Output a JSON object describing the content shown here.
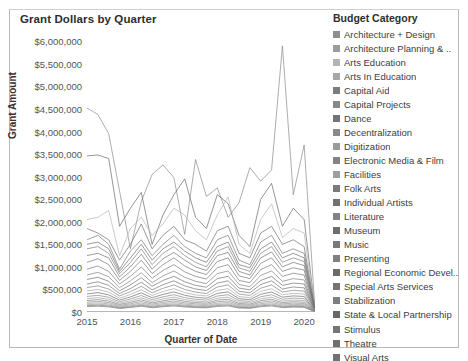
{
  "chart_title": "Grant Dollars by Quarter",
  "axes": {
    "y_title": "Grant Amount",
    "x_title": "Quarter of Date",
    "y_ticks": [
      "$0",
      "$500,000",
      "$1,000,000",
      "$1,500,000",
      "$2,000,000",
      "$2,500,000",
      "$3,000,000",
      "$3,500,000",
      "$4,000,000",
      "$4,500,000",
      "$5,000,000",
      "$5,500,000",
      "$6,000,000"
    ],
    "x_ticks": [
      "2015",
      "2016",
      "2017",
      "2018",
      "2019",
      "2020"
    ]
  },
  "legend": {
    "title": "Budget Category",
    "items": [
      {
        "label": "Architecture + Design",
        "color": "#8e8e8e"
      },
      {
        "label": "Architecture Planning & ..",
        "color": "#9c9c9c"
      },
      {
        "label": "Arts Education",
        "color": "#b4b4b4"
      },
      {
        "label": "Arts In Education",
        "color": "#a7a7a7"
      },
      {
        "label": "Capital Aid",
        "color": "#7d7d7d"
      },
      {
        "label": "Capital Projects",
        "color": "#888888"
      },
      {
        "label": "Dance",
        "color": "#757575"
      },
      {
        "label": "Decentralization",
        "color": "#8a8a8a"
      },
      {
        "label": "Digitization",
        "color": "#9a9a9a"
      },
      {
        "label": "Electronic Media & Film",
        "color": "#838383"
      },
      {
        "label": "Facilities",
        "color": "#9f9f9f"
      },
      {
        "label": "Folk Arts",
        "color": "#7a7a7a"
      },
      {
        "label": "Individual Artists",
        "color": "#717171"
      },
      {
        "label": "Literature",
        "color": "#828282"
      },
      {
        "label": "Museum",
        "color": "#6e6e6e"
      },
      {
        "label": "Music",
        "color": "#787878"
      },
      {
        "label": "Presenting",
        "color": "#808080"
      },
      {
        "label": "Regional Economic Devel..",
        "color": "#6b6b6b"
      },
      {
        "label": "Special Arts Services",
        "color": "#747474"
      },
      {
        "label": "Stabilization",
        "color": "#7e7e7e"
      },
      {
        "label": "State & Local Partnership",
        "color": "#686868"
      },
      {
        "label": "Stimulus",
        "color": "#767676"
      },
      {
        "label": "Theatre",
        "color": "#6f6f6f"
      },
      {
        "label": "Visual Arts",
        "color": "#727272"
      }
    ]
  },
  "chart_data": {
    "type": "line",
    "title": "Grant Dollars by Quarter",
    "xlabel": "Quarter of Date",
    "ylabel": "Grant Amount",
    "ylim": [
      0,
      6250000
    ],
    "xlim": [
      2015.0,
      2020.25
    ],
    "grid": false,
    "legend_position": "right",
    "x": [
      2015.0,
      2015.25,
      2015.5,
      2015.75,
      2016.0,
      2016.25,
      2016.5,
      2016.75,
      2017.0,
      2017.25,
      2017.5,
      2017.75,
      2018.0,
      2018.25,
      2018.5,
      2018.75,
      2019.0,
      2019.25,
      2019.5,
      2019.75,
      2020.0,
      2020.25
    ],
    "series": [
      {
        "name": "Decentralization",
        "values": [
          4520000,
          4380000,
          3950000,
          2680000,
          1400000,
          2450000,
          3050000,
          3260000,
          2980000,
          1720000,
          3380000,
          2560000,
          2750000,
          2100000,
          2420000,
          3200000,
          2900000,
          3150000,
          5900000,
          2600000,
          3700000,
          60000
        ]
      },
      {
        "name": "State & Local Partnership",
        "values": [
          3460000,
          3480000,
          3400000,
          1900000,
          2300000,
          2650000,
          1500000,
          2150000,
          2600000,
          2950000,
          2100000,
          1850000,
          2600000,
          2400000,
          1700000,
          1450000,
          2500000,
          2850000,
          1900000,
          2300000,
          2050000,
          55000
        ]
      },
      {
        "name": "Arts Education",
        "values": [
          2050000,
          2100000,
          2250000,
          1250000,
          1850000,
          2100000,
          1700000,
          1950000,
          2300000,
          2150000,
          1800000,
          1600000,
          2150000,
          2550000,
          1500000,
          1300000,
          2050000,
          2400000,
          1650000,
          1850000,
          1750000,
          50000
        ]
      },
      {
        "name": "Museum",
        "values": [
          1850000,
          1750000,
          1600000,
          1150000,
          1500000,
          1950000,
          1400000,
          1700000,
          1900000,
          1600000,
          1500000,
          1350000,
          1800000,
          1900000,
          1300000,
          1200000,
          1750000,
          1900000,
          1500000,
          1600000,
          1450000,
          48000
        ]
      },
      {
        "name": "Music",
        "values": [
          1600000,
          1700000,
          1500000,
          950000,
          1350000,
          1600000,
          1250000,
          1500000,
          1700000,
          1450000,
          1300000,
          1200000,
          1600000,
          1700000,
          1150000,
          1050000,
          1550000,
          1700000,
          1300000,
          1400000,
          1300000,
          45000
        ]
      },
      {
        "name": "Theatre",
        "values": [
          1500000,
          1550000,
          1400000,
          900000,
          1200000,
          1500000,
          1150000,
          1400000,
          1550000,
          1350000,
          1200000,
          1100000,
          1450000,
          1550000,
          1050000,
          980000,
          1400000,
          1550000,
          1200000,
          1300000,
          1200000,
          43000
        ]
      },
      {
        "name": "Presenting",
        "values": [
          1400000,
          1450000,
          1300000,
          850000,
          1100000,
          1400000,
          1050000,
          1300000,
          1450000,
          1250000,
          1100000,
          1000000,
          1350000,
          1450000,
          980000,
          900000,
          1300000,
          1450000,
          1100000,
          1200000,
          1120000,
          40000
        ]
      },
      {
        "name": "Visual Arts",
        "values": [
          1250000,
          1300000,
          1200000,
          780000,
          1000000,
          1280000,
          950000,
          1180000,
          1320000,
          1150000,
          1000000,
          920000,
          1250000,
          1320000,
          900000,
          820000,
          1200000,
          1330000,
          1000000,
          1100000,
          1030000,
          38000
        ]
      },
      {
        "name": "Dance",
        "values": [
          1100000,
          1180000,
          1050000,
          700000,
          900000,
          1150000,
          850000,
          1050000,
          1200000,
          1020000,
          900000,
          830000,
          1120000,
          1200000,
          800000,
          740000,
          1080000,
          1200000,
          900000,
          980000,
          930000,
          36000
        ]
      },
      {
        "name": "Folk Arts",
        "values": [
          950000,
          1020000,
          900000,
          620000,
          790000,
          1000000,
          750000,
          920000,
          1050000,
          890000,
          790000,
          730000,
          980000,
          1050000,
          700000,
          650000,
          940000,
          1050000,
          790000,
          860000,
          820000,
          33000
        ]
      },
      {
        "name": "Literature",
        "values": [
          820000,
          880000,
          780000,
          540000,
          690000,
          870000,
          650000,
          800000,
          910000,
          770000,
          680000,
          630000,
          850000,
          910000,
          610000,
          560000,
          810000,
          910000,
          680000,
          740000,
          710000,
          30000
        ]
      },
      {
        "name": "Individual Artists",
        "values": [
          720000,
          770000,
          680000,
          470000,
          600000,
          760000,
          570000,
          700000,
          790000,
          670000,
          590000,
          550000,
          740000,
          790000,
          530000,
          490000,
          700000,
          790000,
          590000,
          640000,
          620000,
          28000
        ]
      },
      {
        "name": "Special Arts Services",
        "values": [
          620000,
          670000,
          590000,
          410000,
          520000,
          660000,
          490000,
          605000,
          690000,
          580000,
          510000,
          475000,
          640000,
          690000,
          460000,
          425000,
          610000,
          690000,
          510000,
          555000,
          535000,
          25000
        ]
      },
      {
        "name": "Electronic Media & Film",
        "values": [
          540000,
          580000,
          510000,
          355000,
          450000,
          570000,
          425000,
          525000,
          600000,
          500000,
          440000,
          410000,
          555000,
          600000,
          398000,
          368000,
          528000,
          598000,
          442000,
          480000,
          463000,
          23000
        ]
      },
      {
        "name": "Arts In Education",
        "values": [
          465000,
          500000,
          440000,
          306000,
          388000,
          492000,
          367000,
          453000,
          517000,
          431000,
          380000,
          354000,
          478000,
          517000,
          343000,
          317000,
          455000,
          515000,
          381000,
          414000,
          399000,
          21000
        ]
      },
      {
        "name": "Regional Economic Devel..",
        "values": [
          400000,
          430000,
          379000,
          264000,
          334000,
          424000,
          316000,
          390000,
          445000,
          371000,
          327000,
          305000,
          412000,
          445000,
          295000,
          273000,
          392000,
          444000,
          328000,
          357000,
          344000,
          19000
        ]
      },
      {
        "name": "Capital Projects",
        "values": [
          344000,
          370000,
          326000,
          227000,
          288000,
          365000,
          272000,
          336000,
          383000,
          319000,
          282000,
          263000,
          354000,
          383000,
          254000,
          235000,
          337000,
          382000,
          282000,
          307000,
          296000,
          17000
        ]
      },
      {
        "name": "Facilities",
        "values": [
          296000,
          318000,
          281000,
          195000,
          248000,
          314000,
          234000,
          289000,
          330000,
          275000,
          243000,
          226000,
          305000,
          330000,
          219000,
          202000,
          290000,
          329000,
          243000,
          264000,
          255000,
          15000
        ]
      },
      {
        "name": "Capital Aid",
        "values": [
          254000,
          274000,
          241000,
          168000,
          213000,
          270000,
          201000,
          248000,
          284000,
          236000,
          209000,
          195000,
          262000,
          284000,
          188000,
          174000,
          250000,
          283000,
          209000,
          227000,
          219000,
          13500
        ]
      },
      {
        "name": "Architecture + Design",
        "values": [
          219000,
          236000,
          208000,
          145000,
          183000,
          233000,
          173000,
          214000,
          244000,
          203000,
          180000,
          168000,
          226000,
          244000,
          162000,
          150000,
          215000,
          244000,
          180000,
          196000,
          189000,
          12000
        ]
      },
      {
        "name": "Architecture Planning & ..",
        "values": [
          188000,
          203000,
          179000,
          125000,
          158000,
          200000,
          149000,
          184000,
          210000,
          175000,
          155000,
          144000,
          194000,
          210000,
          140000,
          129000,
          185000,
          210000,
          155000,
          168000,
          163000,
          10500
        ]
      },
      {
        "name": "Digitization",
        "values": [
          162000,
          175000,
          154000,
          107000,
          136000,
          172000,
          128000,
          158000,
          181000,
          150000,
          133000,
          124000,
          167000,
          181000,
          120000,
          111000,
          159000,
          181000,
          133000,
          145000,
          140000,
          9000
        ]
      },
      {
        "name": "Stabilization",
        "values": [
          139000,
          150000,
          133000,
          92000,
          117000,
          148000,
          110000,
          136000,
          156000,
          130000,
          115000,
          107000,
          144000,
          156000,
          103000,
          95000,
          137000,
          156000,
          115000,
          125000,
          121000,
          7500
        ]
      },
      {
        "name": "Stimulus",
        "values": [
          120000,
          129000,
          114000,
          79000,
          101000,
          128000,
          95000,
          117000,
          134000,
          112000,
          99000,
          92000,
          124000,
          134000,
          89000,
          82000,
          118000,
          134000,
          99000,
          108000,
          104000,
          6000
        ]
      }
    ]
  }
}
